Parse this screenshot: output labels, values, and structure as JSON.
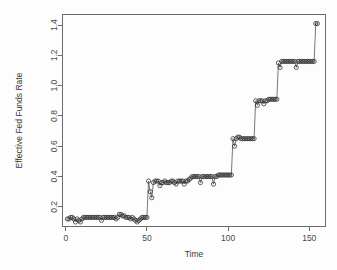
{
  "chart_data": {
    "type": "line",
    "title": "",
    "xlabel": "Time",
    "ylabel": "Effective Fed Funds Rate",
    "xlim": [
      -2,
      160
    ],
    "ylim": [
      0.07,
      1.47
    ],
    "xticks": [
      0,
      50,
      100,
      150
    ],
    "xtick_labels": [
      "0",
      "50",
      "100",
      "150"
    ],
    "yticks": [
      0.2,
      0.4,
      0.6,
      0.8,
      1.0,
      1.2,
      1.4
    ],
    "ytick_labels": [
      "0.2",
      "0.4",
      "0.6",
      "0.8",
      "1.0",
      "1.2",
      "1.4"
    ],
    "grid": false,
    "legend": false,
    "marker": "open-circle",
    "line_color": "#555555",
    "marker_color": "#2e2e2e",
    "series": [
      {
        "name": "Effective Fed Funds Rate",
        "x": [
          1,
          2,
          3,
          4,
          5,
          6,
          7,
          8,
          9,
          10,
          11,
          12,
          13,
          14,
          15,
          16,
          17,
          18,
          19,
          20,
          21,
          22,
          23,
          24,
          25,
          26,
          27,
          28,
          29,
          30,
          31,
          32,
          33,
          34,
          35,
          36,
          37,
          38,
          39,
          40,
          41,
          42,
          43,
          44,
          45,
          46,
          47,
          48,
          49,
          50,
          51,
          52,
          53,
          54,
          55,
          56,
          57,
          58,
          59,
          60,
          61,
          62,
          63,
          64,
          65,
          66,
          67,
          68,
          69,
          70,
          71,
          72,
          73,
          74,
          75,
          76,
          77,
          78,
          79,
          80,
          81,
          82,
          83,
          84,
          85,
          86,
          87,
          88,
          89,
          90,
          91,
          92,
          93,
          94,
          95,
          96,
          97,
          98,
          99,
          100,
          101,
          102,
          103,
          104,
          105,
          106,
          107,
          108,
          109,
          110,
          111,
          112,
          113,
          114,
          115,
          116,
          117,
          118,
          119,
          120,
          121,
          122,
          123,
          124,
          125,
          126,
          127,
          128,
          129,
          130,
          131,
          132,
          133,
          134,
          135,
          136,
          137,
          138,
          139,
          140,
          141,
          142,
          143,
          144,
          145,
          146,
          147,
          148,
          149,
          150,
          151,
          152,
          153,
          154,
          155
        ],
        "y": [
          0.12,
          0.12,
          0.13,
          0.13,
          0.12,
          0.1,
          0.12,
          0.11,
          0.1,
          0.12,
          0.13,
          0.13,
          0.13,
          0.13,
          0.13,
          0.13,
          0.13,
          0.13,
          0.13,
          0.13,
          0.13,
          0.11,
          0.13,
          0.13,
          0.13,
          0.13,
          0.13,
          0.13,
          0.13,
          0.13,
          0.12,
          0.13,
          0.15,
          0.15,
          0.14,
          0.14,
          0.13,
          0.13,
          0.13,
          0.12,
          0.13,
          0.12,
          0.11,
          0.1,
          0.11,
          0.12,
          0.13,
          0.13,
          0.13,
          0.13,
          0.37,
          0.3,
          0.26,
          0.36,
          0.37,
          0.37,
          0.37,
          0.34,
          0.36,
          0.36,
          0.37,
          0.36,
          0.36,
          0.36,
          0.37,
          0.37,
          0.36,
          0.35,
          0.37,
          0.37,
          0.37,
          0.37,
          0.35,
          0.37,
          0.37,
          0.38,
          0.39,
          0.4,
          0.4,
          0.4,
          0.4,
          0.4,
          0.36,
          0.4,
          0.4,
          0.4,
          0.4,
          0.4,
          0.4,
          0.4,
          0.35,
          0.4,
          0.4,
          0.41,
          0.41,
          0.41,
          0.41,
          0.41,
          0.41,
          0.41,
          0.41,
          0.41,
          0.65,
          0.6,
          0.65,
          0.66,
          0.66,
          0.65,
          0.65,
          0.65,
          0.65,
          0.65,
          0.65,
          0.65,
          0.65,
          0.65,
          0.9,
          0.87,
          0.9,
          0.9,
          0.9,
          0.88,
          0.9,
          0.9,
          0.91,
          0.91,
          0.91,
          0.91,
          0.91,
          0.91,
          1.15,
          1.12,
          1.16,
          1.16,
          1.16,
          1.16,
          1.16,
          1.16,
          1.16,
          1.16,
          1.16,
          1.12,
          1.16,
          1.16,
          1.16,
          1.16,
          1.16,
          1.16,
          1.16,
          1.16,
          1.16,
          1.16,
          1.16,
          1.41,
          1.41
        ]
      }
    ]
  }
}
